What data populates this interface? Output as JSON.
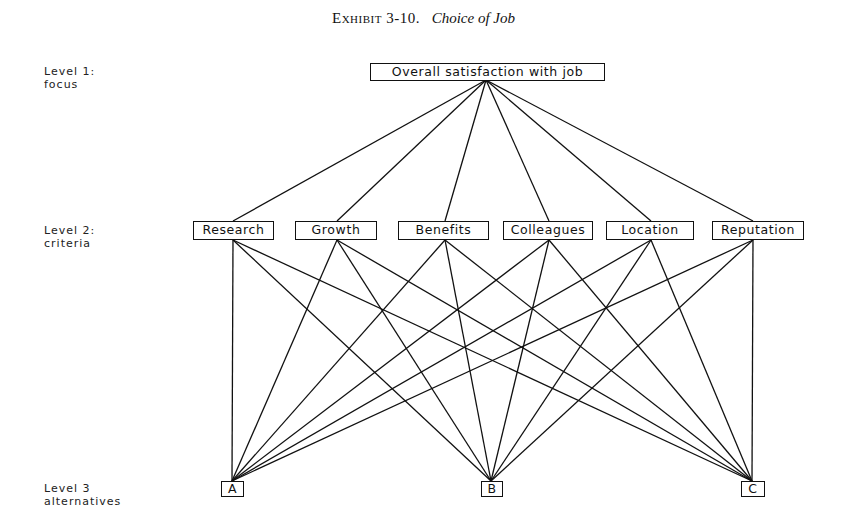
{
  "title": {
    "exhibit": "Exhibit 3-10.",
    "name": "Choice of Job"
  },
  "levels": [
    {
      "label_line1": "Level 1:",
      "label_line2": "focus"
    },
    {
      "label_line1": "Level 2:",
      "label_line2": "criteria"
    },
    {
      "label_line1": "Level 3",
      "label_line2": "alternatives"
    }
  ],
  "focus": {
    "label": "Overall satisfaction with job"
  },
  "criteria": [
    {
      "label": "Research"
    },
    {
      "label": "Growth"
    },
    {
      "label": "Benefits"
    },
    {
      "label": "Colleagues"
    },
    {
      "label": "Location"
    },
    {
      "label": "Reputation"
    }
  ],
  "alternatives": [
    {
      "label": "A"
    },
    {
      "label": "B"
    },
    {
      "label": "C"
    }
  ],
  "colors": {
    "line": "#111111",
    "background": "#ffffff"
  }
}
